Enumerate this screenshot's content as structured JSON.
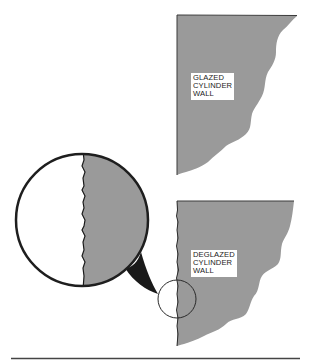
{
  "diagram": {
    "type": "illustration",
    "colors": {
      "wall_fill": "#9a9a9a",
      "outline": "#1e1e1e",
      "callout_tail": "#1a1a1a",
      "background": "#ffffff",
      "rule": "#444444"
    },
    "panels": [
      {
        "id": "glazed",
        "label_lines": [
          "GLAZED",
          "CYLINDER",
          "WALL"
        ]
      },
      {
        "id": "deglazed",
        "label_lines": [
          "DEGLAZED",
          "CYLINDER",
          "WALL"
        ]
      }
    ],
    "magnifier": {
      "description": "enlarged view of deglazed wall surface edge showing roughened texture"
    }
  }
}
